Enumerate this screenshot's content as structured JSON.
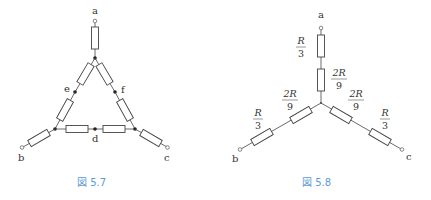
{
  "figures": [
    {
      "id": "fig-5-7",
      "caption": "図 5.7",
      "terminals": {
        "a": "a",
        "b": "b",
        "c": "c"
      },
      "midpoints": {
        "d": "d",
        "e": "e",
        "f": "f"
      }
    },
    {
      "id": "fig-5-8",
      "caption": "図 5.8",
      "terminals": {
        "a": "a",
        "b": "b",
        "c": "c"
      },
      "resistor_values": {
        "outer": {
          "num": "R",
          "den": "3"
        },
        "inner": {
          "num": "2R",
          "den": "9"
        }
      }
    }
  ],
  "colors": {
    "caption": "#5b9bd5",
    "line": "#444444"
  }
}
